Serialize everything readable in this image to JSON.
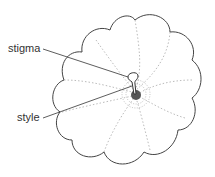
{
  "diagram": {
    "labels": [
      {
        "id": "stigma",
        "text": "stigma"
      },
      {
        "id": "style",
        "text": "style"
      }
    ]
  }
}
